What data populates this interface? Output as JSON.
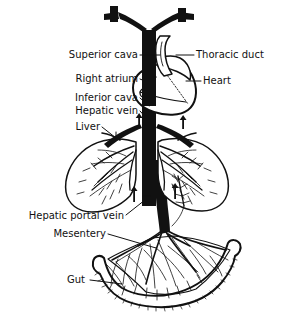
{
  "figure": {
    "background_color": "#ffffff",
    "ink_color": "#111111",
    "labels": [
      {
        "id": "superior-cava",
        "text": "Superior cava",
        "side": "left",
        "x": 138,
        "y": 58
      },
      {
        "id": "right-atrium",
        "text": "Right atrium",
        "side": "left",
        "x": 138,
        "y": 82
      },
      {
        "id": "inferior-cava",
        "text": "Inferior cava",
        "side": "left",
        "x": 138,
        "y": 101
      },
      {
        "id": "hepatic-vein",
        "text": "Hepatic vein",
        "side": "left",
        "x": 138,
        "y": 114
      },
      {
        "id": "liver",
        "text": "Liver",
        "side": "left",
        "x": 100,
        "y": 130
      },
      {
        "id": "thoracic-duct",
        "text": "Thoracic duct",
        "side": "right",
        "x": 196,
        "y": 58
      },
      {
        "id": "heart",
        "text": "Heart",
        "side": "right",
        "x": 203,
        "y": 84
      },
      {
        "id": "hepatic-portal-vein",
        "text": "Hepatic portal vein",
        "side": "left",
        "x": 124,
        "y": 219
      },
      {
        "id": "mesentery",
        "text": "Mesentery",
        "side": "left",
        "x": 106,
        "y": 237
      },
      {
        "id": "gut",
        "text": "Gut",
        "side": "left",
        "x": 85,
        "y": 283
      }
    ],
    "structures": [
      {
        "id": "superior-vena-cava",
        "kind": "vessel",
        "fill": "solid-black"
      },
      {
        "id": "inferior-vena-cava",
        "kind": "vessel",
        "fill": "solid-black"
      },
      {
        "id": "heart",
        "kind": "organ",
        "fill": "white-outline"
      },
      {
        "id": "thoracic-duct",
        "kind": "duct",
        "fill": "white-outline"
      },
      {
        "id": "liver",
        "kind": "organ",
        "fill": "white-outline"
      },
      {
        "id": "hepatic-vein",
        "kind": "vessel",
        "fill": "solid-black"
      },
      {
        "id": "hepatic-portal-vein",
        "kind": "vessel",
        "fill": "solid-black"
      },
      {
        "id": "mesentery",
        "kind": "membrane",
        "fill": "white-outline"
      },
      {
        "id": "gut",
        "kind": "organ",
        "fill": "white-outline-hatched"
      }
    ],
    "flow_arrows": [
      {
        "id": "flow-arrow-left-upper",
        "direction": "up",
        "x": 139,
        "y": 122
      },
      {
        "id": "flow-arrow-right-upper",
        "direction": "up",
        "x": 183,
        "y": 124
      },
      {
        "id": "flow-arrow-left-lower",
        "direction": "up",
        "x": 134,
        "y": 196
      },
      {
        "id": "flow-arrow-right-lower",
        "direction": "up",
        "x": 175,
        "y": 193
      }
    ]
  }
}
